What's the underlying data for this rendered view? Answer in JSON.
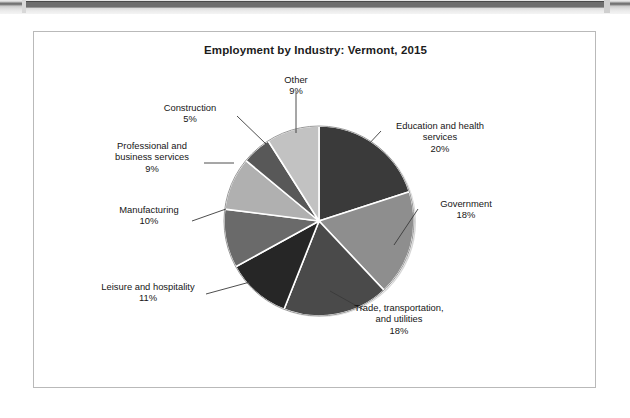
{
  "page": {
    "background": "#ffffff",
    "scan_artifact": "scanned-page-edge-strip"
  },
  "chart_frame": {
    "border_color": "#b9b9b9",
    "background": "#ffffff"
  },
  "chart_data": {
    "type": "pie",
    "title": "Employment by Industry: Vermont, 2015",
    "subtitle": "",
    "xlabel": "",
    "ylabel": "",
    "units": "percent of total employment",
    "legend_position": "none",
    "labels_position": "outside-with-leader-lines",
    "start_angle_deg": 0,
    "direction": "clockwise",
    "categories": [
      "Education and health services",
      "Government",
      "Trade, transportation, and utilities",
      "Leisure and hospitality",
      "Manufacturing",
      "Professional and business services",
      "Construction",
      "Other"
    ],
    "values": [
      20,
      18,
      18,
      11,
      10,
      9,
      5,
      9
    ],
    "value_labels": [
      "20%",
      "18%",
      "18%",
      "11%",
      "10%",
      "9%",
      "5%",
      "9%"
    ],
    "colors": [
      "#3a3a3a",
      "#8e8e8e",
      "#4a4a4a",
      "#262626",
      "#6a6a6a",
      "#b0b0b0",
      "#585858",
      "#c2c2c2"
    ],
    "slices": [
      {
        "name": "Education and health services",
        "value": 20,
        "label": "20%",
        "color": "#3a3a3a"
      },
      {
        "name": "Government",
        "value": 18,
        "label": "18%",
        "color": "#8e8e8e"
      },
      {
        "name": "Trade, transportation, and utilities",
        "value": 18,
        "label": "18%",
        "color": "#4a4a4a"
      },
      {
        "name": "Leisure and hospitality",
        "value": 11,
        "label": "11%",
        "color": "#262626"
      },
      {
        "name": "Manufacturing",
        "value": 10,
        "label": "10%",
        "color": "#6a6a6a"
      },
      {
        "name": "Professional and business services",
        "value": 9,
        "label": "9%",
        "color": "#b0b0b0"
      },
      {
        "name": "Construction",
        "value": 5,
        "label": "5%",
        "color": "#585858"
      },
      {
        "name": "Other",
        "value": 9,
        "label": "9%",
        "color": "#c2c2c2"
      }
    ]
  },
  "callouts": {
    "other": {
      "name": "Other",
      "pct": "9%"
    },
    "construction": {
      "name": "Construction",
      "pct": "5%"
    },
    "professional_1": {
      "name": "Professional and"
    },
    "professional_2": {
      "name": "business services",
      "pct": "9%"
    },
    "manufacturing": {
      "name": "Manufacturing",
      "pct": "10%"
    },
    "leisure": {
      "name": "Leisure and hospitality",
      "pct": "11%"
    },
    "trade_1": {
      "name": "Trade, transportation,"
    },
    "trade_2": {
      "name": "and utilities",
      "pct": "18%"
    },
    "government": {
      "name": "Government",
      "pct": "18%"
    },
    "education_1": {
      "name": "Education and health"
    },
    "education_2": {
      "name": "services",
      "pct": "20%"
    }
  }
}
